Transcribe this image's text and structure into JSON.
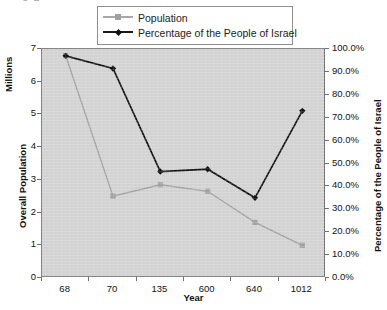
{
  "top_sliver_text": "o p ,",
  "legend": {
    "position": "top-center",
    "items": [
      {
        "label": "Population",
        "marker": "square-marker-icon",
        "color": "#a0a0a0"
      },
      {
        "label": "Percentage of the People of Israel",
        "marker": "diamond-marker-icon",
        "color": "#111111"
      }
    ]
  },
  "axes": {
    "y_left_title": "Overall Population",
    "y_left_unit_title": "Millions",
    "y_right_title": "Percentage of the People of Israel",
    "x_title": "Year",
    "y_left_ticks": [
      "0",
      "1",
      "2",
      "3",
      "4",
      "5",
      "6",
      "7"
    ],
    "y_right_ticks": [
      "0.0%",
      "10.0%",
      "20.0%",
      "30.0%",
      "40.0%",
      "50.0%",
      "60.0%",
      "70.0%",
      "80.0%",
      "90.0%",
      "100.0%"
    ]
  },
  "colors": {
    "plot_background": "#d2d2d2",
    "plot_border": "#6f6f6f",
    "population_series": "#a0a0a0",
    "percentage_series": "#111111",
    "text": "#111111",
    "page_background": "#ffffff"
  },
  "chart_data": {
    "type": "line",
    "title": "",
    "xlabel": "Year",
    "ylabel": "Overall Population",
    "categories": [
      "68",
      "70",
      "135",
      "600",
      "640",
      "1012"
    ],
    "grid": false,
    "legend_position": "top-center",
    "axes": {
      "left": {
        "label": "Overall Population (Millions)",
        "ylim": [
          0,
          7
        ],
        "ticks": [
          0,
          1,
          2,
          3,
          4,
          5,
          6,
          7
        ]
      },
      "right": {
        "label": "Percentage of the People of Israel",
        "ylim": [
          0,
          100
        ],
        "unit": "%",
        "ticks": [
          0,
          10,
          20,
          30,
          40,
          50,
          60,
          70,
          80,
          90,
          100
        ]
      }
    },
    "series": [
      {
        "name": "Population",
        "axis": "left",
        "unit": "Millions",
        "color": "#a0a0a0",
        "marker": "square",
        "values": [
          6.8,
          2.5,
          2.85,
          2.65,
          1.7,
          1.0
        ]
      },
      {
        "name": "Percentage of the People of Israel",
        "axis": "right",
        "unit": "%",
        "color": "#111111",
        "marker": "diamond",
        "values": [
          97.0,
          91.5,
          46.5,
          47.5,
          35.0,
          73.0
        ]
      }
    ]
  }
}
